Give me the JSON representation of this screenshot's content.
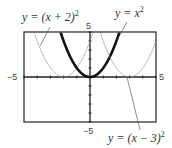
{
  "chart_data": {
    "type": "line",
    "title": "",
    "xlabel": "",
    "ylabel": "",
    "xlim": [
      -5,
      5
    ],
    "ylim": [
      -5,
      5
    ],
    "grid": false,
    "tick_labels": {
      "x_min": "−5",
      "x_max": "5",
      "y_min": "−5",
      "y_max": "5"
    },
    "series": [
      {
        "name": "y = (x + 2)^2",
        "label_main": "y = (x + 2)",
        "label_exp": "2",
        "shift": -2,
        "style": "light",
        "vertex": [
          -2,
          0
        ]
      },
      {
        "name": "y = x^2",
        "label_main": "y = x",
        "label_exp": "2",
        "shift": 0,
        "style": "bold",
        "vertex": [
          0,
          0
        ]
      },
      {
        "name": "y = (x − 3)^2",
        "label_main": "y = (x − 3)",
        "label_exp": "2",
        "shift": 3,
        "style": "light",
        "vertex": [
          3,
          0
        ]
      }
    ],
    "colors": {
      "light": "#8a8a8a",
      "bold": "#111111",
      "axis": "#222222",
      "frame": "#333333"
    }
  }
}
